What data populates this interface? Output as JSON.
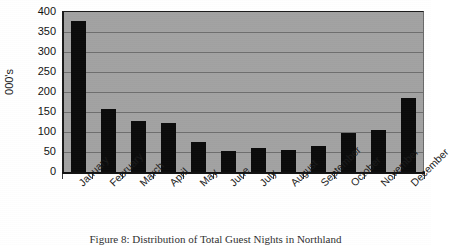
{
  "chart_data": {
    "type": "bar",
    "title": "",
    "subtitle": "",
    "xlabel": "",
    "ylabel": "000's",
    "ylim": [
      0,
      400
    ],
    "ytick_interval": 50,
    "yticks": [
      400,
      350,
      300,
      250,
      200,
      150,
      100,
      50,
      0
    ],
    "ytick_labels": [
      "400",
      "350",
      "300",
      "250",
      "200",
      "150",
      "100",
      "50",
      "0"
    ],
    "grid": true,
    "grid_axis": "y",
    "legend": false,
    "legend_position": "none",
    "categories": [
      "January",
      "February",
      "March",
      "April",
      "May",
      "June",
      "July",
      "August",
      "September",
      "October",
      "November",
      "December"
    ],
    "values": [
      378,
      157,
      128,
      122,
      74,
      52,
      59,
      56,
      66,
      97,
      105,
      185
    ],
    "series": [
      {
        "name": "Total Guest Nights",
        "values": [
          378,
          157,
          128,
          122,
          74,
          52,
          59,
          56,
          66,
          97,
          105,
          185
        ]
      }
    ],
    "bar_color": "#0b0b0b",
    "plot_background": "#a2a2a2",
    "gridline_color": "#6f6f6f",
    "axis_color": "#111111"
  },
  "caption": {
    "text": "Figure 8: Distribution of Total Guest Nights in Northland"
  }
}
